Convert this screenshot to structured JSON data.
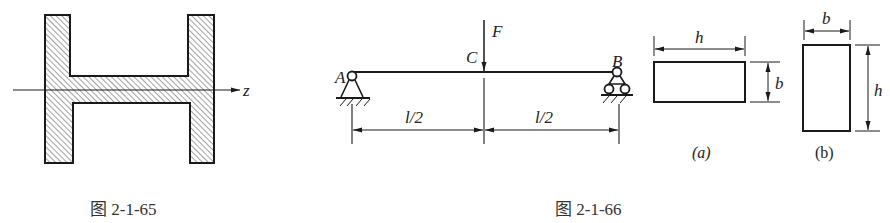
{
  "figures": [
    {
      "id": "fig-2-1-65",
      "caption": "图 2-1-65",
      "description": "Hatched I-section (H-shape rotated) with horizontal neutral axis",
      "axis_label": "z"
    },
    {
      "id": "fig-2-1-66",
      "caption": "图 2-1-66",
      "beam": {
        "support_left_label": "A",
        "support_right_label": "B",
        "load_point_label": "C",
        "force_label": "F",
        "span_left_label": "l/2",
        "span_right_label": "l/2"
      },
      "sections": [
        {
          "label": "(a)",
          "width_dim": "h",
          "height_dim": "b"
        },
        {
          "label": "(b)",
          "width_dim": "b",
          "height_dim": "h"
        }
      ]
    }
  ],
  "colors": {
    "line": "#1a1a1a",
    "hatch": "#444444",
    "text": "#222222",
    "background": "#ffffff"
  }
}
